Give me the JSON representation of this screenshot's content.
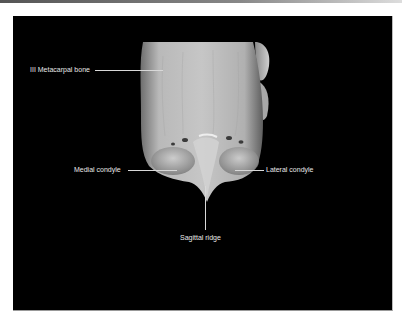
{
  "figure": {
    "labels": {
      "metacarpal": "III Metacarpal bone",
      "medial_condyle": "Medial condyle",
      "lateral_condyle": "Lateral condyle",
      "sagittal_ridge": "Sagittal ridge"
    },
    "colors": {
      "background": "#000000",
      "label_text": "#e8e8e8",
      "bone_light": "#c8c8c8",
      "bone_dark": "#6a6a6a"
    }
  }
}
